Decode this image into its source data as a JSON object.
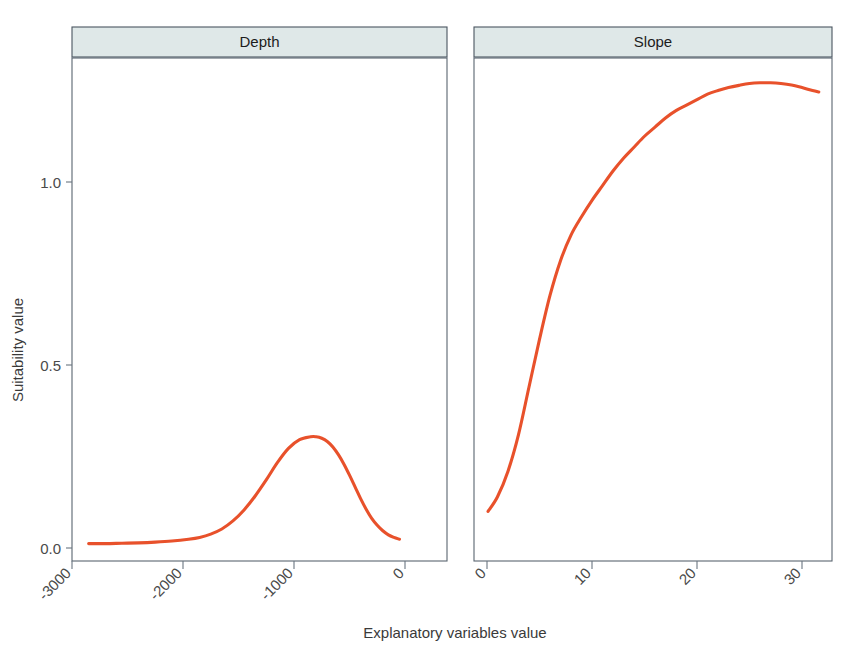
{
  "figure": {
    "background_color": "#ffffff",
    "strip_fill": "#dfe8e8",
    "strip_border": "#4a5560",
    "panel_border": "#5a6570",
    "line_color": "#e8512b"
  },
  "axis": {
    "x_title": "Explanatory variables value",
    "y_title": "Suitability value"
  },
  "panels": {
    "depth": {
      "strip_label": "Depth",
      "x_ticks": [
        "-3000",
        "-2000",
        "-1000",
        "0"
      ],
      "y_ticks": [
        "0.0",
        "0.5",
        "1.0"
      ]
    },
    "slope": {
      "strip_label": "Slope",
      "x_ticks": [
        "0",
        "10",
        "20",
        "30"
      ],
      "y_ticks": [
        "0.0",
        "0.5",
        "1.0"
      ]
    }
  },
  "chart_data": [
    {
      "type": "line",
      "title": "Depth",
      "panel": "Depth",
      "xlabel": "Explanatory variables value",
      "ylabel": "Suitability value",
      "xlim": [
        -3050,
        30
      ],
      "ylim": [
        -0.03,
        1.33
      ],
      "xticks": [
        -3000,
        -2000,
        -1000,
        0
      ],
      "yticks": [
        0.0,
        0.5,
        1.0
      ],
      "grid": false,
      "legend": "none",
      "line_color": "#e8512b",
      "series": [
        {
          "name": "Depth suitability",
          "x": [
            -2850,
            -2700,
            -2550,
            -2400,
            -2250,
            -2100,
            -1950,
            -1850,
            -1750,
            -1650,
            -1550,
            -1450,
            -1350,
            -1250,
            -1150,
            -1050,
            -950,
            -850,
            -800,
            -750,
            -700,
            -650,
            -600,
            -550,
            -500,
            -450,
            -400,
            -350,
            -300,
            -250,
            -200,
            -150,
            -100,
            -50
          ],
          "y": [
            0.012,
            0.012,
            0.013,
            0.014,
            0.016,
            0.019,
            0.024,
            0.029,
            0.038,
            0.052,
            0.074,
            0.104,
            0.142,
            0.186,
            0.233,
            0.272,
            0.296,
            0.304,
            0.304,
            0.3,
            0.291,
            0.276,
            0.255,
            0.229,
            0.199,
            0.167,
            0.135,
            0.106,
            0.081,
            0.062,
            0.047,
            0.036,
            0.029,
            0.024
          ]
        }
      ]
    },
    {
      "type": "line",
      "title": "Slope",
      "panel": "Slope",
      "xlabel": "Explanatory variables value",
      "ylabel": "Suitability value",
      "xlim": [
        -0.6,
        32.6
      ],
      "ylim": [
        -0.03,
        1.33
      ],
      "xticks": [
        0,
        10,
        20,
        30
      ],
      "yticks": [
        0.0,
        0.5,
        1.0
      ],
      "grid": false,
      "legend": "none",
      "line_color": "#e8512b",
      "series": [
        {
          "name": "Slope suitability",
          "x": [
            0.1,
            1,
            2,
            3,
            4,
            5,
            6,
            7,
            8,
            9,
            10,
            11,
            12,
            13,
            14,
            15,
            16,
            17,
            18,
            19,
            20,
            21,
            22,
            23,
            24,
            25,
            26,
            27,
            28,
            29,
            30,
            31,
            31.6
          ],
          "y": [
            0.1,
            0.14,
            0.21,
            0.31,
            0.44,
            0.57,
            0.69,
            0.785,
            0.855,
            0.905,
            0.95,
            0.99,
            1.03,
            1.065,
            1.095,
            1.125,
            1.15,
            1.175,
            1.195,
            1.21,
            1.225,
            1.24,
            1.25,
            1.258,
            1.264,
            1.269,
            1.271,
            1.271,
            1.269,
            1.265,
            1.258,
            1.25,
            1.246
          ]
        }
      ]
    }
  ]
}
